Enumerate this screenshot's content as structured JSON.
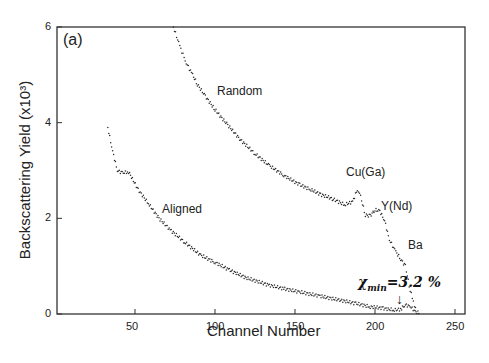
{
  "chart_data": {
    "type": "scatter",
    "title": "",
    "panel_label": "(a)",
    "xlabel": "Channel Number",
    "ylabel": "Backscattering Yield (x10³)",
    "xlim": [
      0,
      255
    ],
    "ylim": [
      0,
      6
    ],
    "xticks": [
      50,
      100,
      150,
      200,
      250
    ],
    "yticks": [
      0,
      2,
      4,
      6
    ],
    "grid": false,
    "series": [
      {
        "name": "Random",
        "x": [
          74,
          78,
          82,
          86,
          89,
          94,
          100,
          108,
          116,
          125,
          134,
          143,
          153,
          160,
          166,
          174,
          181,
          186,
          189,
          191,
          194,
          197,
          200,
          203,
          206,
          209,
          213,
          216,
          219,
          222,
          224,
          226
        ],
        "y": [
          6.0,
          5.6,
          5.25,
          5.0,
          4.8,
          4.55,
          4.27,
          3.95,
          3.64,
          3.35,
          3.1,
          2.9,
          2.7,
          2.6,
          2.5,
          2.4,
          2.28,
          2.35,
          2.6,
          2.45,
          2.07,
          2.05,
          2.18,
          2.15,
          1.95,
          1.55,
          1.3,
          1.15,
          1.0,
          0.5,
          0.25,
          0.05
        ]
      },
      {
        "name": "Aligned",
        "x": [
          33,
          36,
          39,
          42,
          46,
          52,
          59,
          65,
          72,
          81,
          91,
          100,
          109,
          120,
          134,
          143,
          153,
          165,
          178,
          188,
          197,
          205,
          212,
          216,
          219,
          222,
          225,
          228
        ],
        "y": [
          3.9,
          3.4,
          3.0,
          2.95,
          2.97,
          2.6,
          2.28,
          2.0,
          1.76,
          1.5,
          1.23,
          1.08,
          0.92,
          0.75,
          0.6,
          0.53,
          0.46,
          0.38,
          0.29,
          0.22,
          0.15,
          0.12,
          0.08,
          0.1,
          0.19,
          0.16,
          0.05,
          0.02
        ]
      }
    ],
    "annotations": [
      {
        "text": "Random",
        "x": 100,
        "y": 4.6
      },
      {
        "text": "Aligned",
        "x": 67,
        "y": 2.1
      },
      {
        "text": "Cu(Ga)",
        "x": 187,
        "y": 2.7
      },
      {
        "text": "Y(Nd)",
        "x": 200,
        "y": 2.1
      },
      {
        "text": "Ba",
        "x": 219,
        "y": 1.4
      },
      {
        "text": "χmin=3.2 %",
        "x": 218,
        "y": 0.6
      },
      {
        "text": "↓",
        "x": 216,
        "y": 0.2
      }
    ]
  },
  "labels": {
    "panel": "(a)",
    "xlabel": "Channel Number",
    "ylabel": "Backscattering Yield (x10³)",
    "random": "Random",
    "aligned": "Aligned",
    "cu": "Cu(Ga)",
    "y": "Y(Nd)",
    "ba": "Ba",
    "chi_main": "χ",
    "chi_sub": "min",
    "chi_val": "=3.2 %",
    "arrow": "↓"
  },
  "colors": {
    "axis": "#333333",
    "points": "#2a2a2a",
    "background": "#ffffff"
  }
}
